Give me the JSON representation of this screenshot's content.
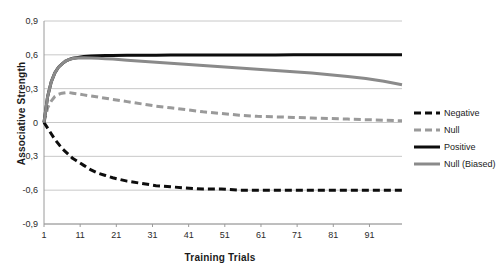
{
  "chart_data": {
    "type": "line",
    "title": "",
    "xlabel": "Training Trials",
    "ylabel": "Associative Strength",
    "xlim": [
      1,
      100
    ],
    "ylim": [
      -0.9,
      0.9
    ],
    "grid": true,
    "legend_position": "right",
    "decimal_separator": ",",
    "x_ticks": [
      "1",
      "11",
      "21",
      "31",
      "41",
      "51",
      "61",
      "71",
      "81",
      "91"
    ],
    "x_tick_values": [
      1,
      11,
      21,
      31,
      41,
      51,
      61,
      71,
      81,
      91
    ],
    "y_ticks": [
      "0,9",
      "0,6",
      "0,3",
      "0",
      "-0,3",
      "-0,6",
      "-0,9"
    ],
    "y_tick_values": [
      0.9,
      0.6,
      0.3,
      0,
      -0.3,
      -0.6,
      -0.9
    ],
    "x": [
      1,
      2,
      3,
      4,
      5,
      6,
      7,
      8,
      9,
      10,
      12,
      14,
      16,
      18,
      20,
      24,
      28,
      32,
      36,
      40,
      45,
      50,
      55,
      60,
      65,
      70,
      75,
      80,
      85,
      90,
      95,
      100
    ],
    "series": [
      {
        "name": "Negative",
        "color": "#0d0d0d",
        "style": "dashed",
        "width": 3,
        "values": [
          0.0,
          -0.05,
          -0.1,
          -0.15,
          -0.19,
          -0.23,
          -0.26,
          -0.29,
          -0.32,
          -0.34,
          -0.38,
          -0.42,
          -0.45,
          -0.47,
          -0.49,
          -0.52,
          -0.54,
          -0.56,
          -0.57,
          -0.58,
          -0.59,
          -0.59,
          -0.6,
          -0.6,
          -0.6,
          -0.6,
          -0.6,
          -0.6,
          -0.6,
          -0.6,
          -0.6,
          -0.6
        ]
      },
      {
        "name": "Null",
        "color": "#9a9a9a",
        "style": "dashed",
        "width": 3,
        "values": [
          0.0,
          0.13,
          0.19,
          0.23,
          0.25,
          0.26,
          0.265,
          0.265,
          0.26,
          0.255,
          0.245,
          0.235,
          0.225,
          0.215,
          0.205,
          0.185,
          0.165,
          0.145,
          0.13,
          0.115,
          0.095,
          0.08,
          0.065,
          0.055,
          0.05,
          0.045,
          0.04,
          0.035,
          0.03,
          0.025,
          0.02,
          0.015
        ]
      },
      {
        "name": "Positive",
        "color": "#0d0d0d",
        "style": "solid",
        "width": 3,
        "values": [
          0.0,
          0.23,
          0.36,
          0.44,
          0.49,
          0.52,
          0.545,
          0.56,
          0.57,
          0.575,
          0.585,
          0.59,
          0.592,
          0.594,
          0.595,
          0.596,
          0.597,
          0.597,
          0.598,
          0.598,
          0.598,
          0.599,
          0.599,
          0.599,
          0.599,
          0.6,
          0.6,
          0.6,
          0.6,
          0.6,
          0.6,
          0.6
        ]
      },
      {
        "name": "Null (Biased)",
        "color": "#8a8a8a",
        "style": "solid",
        "width": 3,
        "values": [
          0.0,
          0.23,
          0.36,
          0.44,
          0.49,
          0.52,
          0.545,
          0.56,
          0.568,
          0.572,
          0.575,
          0.573,
          0.57,
          0.566,
          0.562,
          0.553,
          0.544,
          0.535,
          0.526,
          0.517,
          0.505,
          0.494,
          0.483,
          0.472,
          0.461,
          0.45,
          0.438,
          0.424,
          0.408,
          0.39,
          0.365,
          0.335
        ]
      }
    ],
    "legend": [
      {
        "label": "Negative",
        "color": "#0d0d0d",
        "style": "dashed"
      },
      {
        "label": "Null",
        "color": "#9a9a9a",
        "style": "dashed"
      },
      {
        "label": "Positive",
        "color": "#0d0d0d",
        "style": "solid"
      },
      {
        "label": "Null (Biased)",
        "color": "#8a8a8a",
        "style": "solid"
      }
    ]
  },
  "layout": {
    "plot_left": 44,
    "plot_right": 402,
    "plot_top": 21,
    "plot_bottom": 224,
    "grid_color": "#c8c8c8",
    "axis_color": "#9a9a9a",
    "background": "#ffffff"
  }
}
